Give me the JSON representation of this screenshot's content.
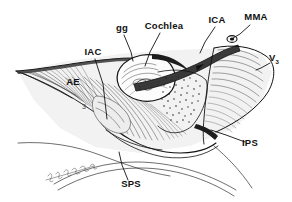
{
  "figure": {
    "kind": "anatomical-line-drawing",
    "background_color": "#ffffff",
    "ink_color": "#111111",
    "width": 292,
    "height": 202
  },
  "labels": [
    {
      "id": "gg",
      "text": "gg",
      "x": 122,
      "y": 31,
      "anchor": "middle",
      "leader": "M 124 35 L 131 52 L 133 61"
    },
    {
      "id": "cochlea",
      "text": "Cochlea",
      "x": 164,
      "y": 29,
      "anchor": "middle",
      "leader": "M 160 33 L 150 52 L 145 66"
    },
    {
      "id": "ica",
      "text": "ICA",
      "x": 217,
      "y": 23,
      "anchor": "middle",
      "leader": "M 215 27 L 205 42 L 200 53"
    },
    {
      "id": "mma",
      "text": "MMA",
      "x": 256,
      "y": 20,
      "anchor": "middle",
      "leader": "M 250 25 L 240 34 L 233 38"
    },
    {
      "id": "v3",
      "text": "V",
      "sub": "3",
      "x": 274,
      "y": 61,
      "anchor": "middle",
      "leader": "M 270 63 L 261 68 L 256 70"
    },
    {
      "id": "iac",
      "text": "IAC",
      "x": 93,
      "y": 55,
      "anchor": "middle",
      "leader": "M 95 59 L 103 84 L 107 119"
    },
    {
      "id": "ae",
      "text": "AE",
      "x": 73,
      "y": 85,
      "anchor": "middle",
      "leader": ""
    },
    {
      "id": "ips",
      "text": "IPS",
      "x": 250,
      "y": 146,
      "anchor": "middle",
      "leader": "M 245 142 L 226 135 L 211 130"
    },
    {
      "id": "sps",
      "text": "SPS",
      "x": 131,
      "y": 187,
      "anchor": "middle",
      "leader": "M 128 180 L 122 165 L 119 152"
    }
  ],
  "inline_numbers": [
    {
      "id": "n3",
      "text": "3",
      "x": 84,
      "y": 109
    },
    {
      "id": "n2",
      "text": "2",
      "x": 139,
      "y": 91
    }
  ],
  "signature": {
    "present": true,
    "legible": false,
    "x": 60,
    "y": 172,
    "description": "cursive artist signature"
  }
}
